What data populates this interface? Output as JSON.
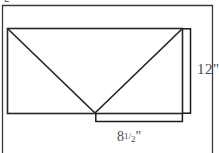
{
  "figure": {
    "cropped_glyph": "g",
    "colors": {
      "stroke": "#262626",
      "frame_stroke": "#333333",
      "dimension_stroke": "#1a1a1a",
      "text": "#4d4d4d",
      "background": "#ffffff"
    },
    "frame": {
      "name": "page-border",
      "top_y": 5,
      "left_x": 2,
      "right_x": 213
    },
    "envelope": {
      "name": "envelope-rectangle",
      "left": 7,
      "top": 28,
      "right": 183,
      "bottom": 113,
      "flap_apex_x": 95,
      "flap_apex_y": 113
    },
    "dimensions": [
      {
        "id": "height",
        "name": "height-dimension",
        "orientation": "vertical",
        "value": "12",
        "unit": "\"",
        "label": "12\"",
        "label_display": "12\"",
        "bracket_x": 190,
        "from_y": 28,
        "to_y": 113
      },
      {
        "id": "width",
        "name": "width-dimension",
        "orientation": "horizontal",
        "value_whole": "8",
        "value_numerator": "1",
        "value_denominator": "2",
        "unit": "\"",
        "label": "8 1/2\"",
        "label_display": "8 1/2\"",
        "bracket_y": 121,
        "from_x": 95,
        "to_x": 183
      }
    ]
  }
}
